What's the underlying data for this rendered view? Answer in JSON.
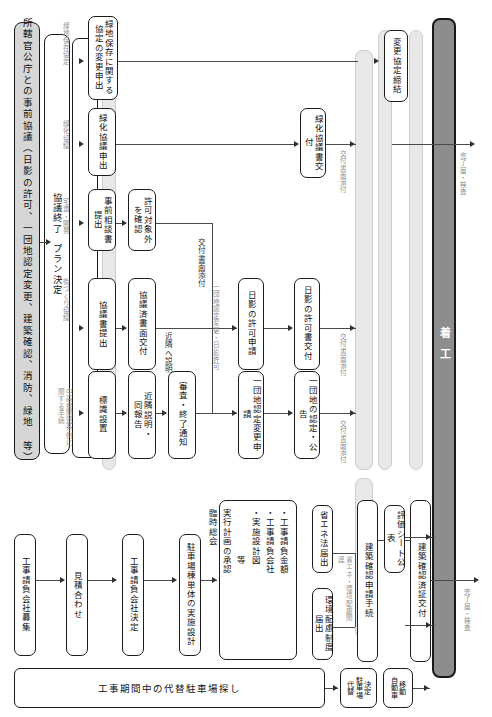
{
  "diagram": {
    "type": "flowchart",
    "orientation": "left-to-right",
    "colors": {
      "line": "#4a4a4a",
      "node_border": "#1c1c1c",
      "lane_fill": "#e8e8e8",
      "pillar_fill": "#d6d6d6",
      "dark_pillar_fill": "#8d8d8d",
      "edge_label": "#8f8f8f",
      "background": "#ffffff"
    }
  },
  "pillars": {
    "consultation": "所轄官公庁との事前協議（日影の許可、一団地認定変更、建築確認、消防、緑地 等）",
    "plan_decided": "協議終了　プラン決定",
    "start_construction": "着工"
  },
  "lanes": [
    {
      "name": "lane-agreement"
    },
    {
      "name": "lane-submission"
    },
    {
      "name": "lane-certificate"
    },
    {
      "name": "lane-energy"
    },
    {
      "name": "lane-confirmation"
    }
  ],
  "branches": [
    {
      "label": "緑地保存協定",
      "nodes": [
        "緑地保存に関する\n協定の変更申出"
      ]
    },
    {
      "label": "緑化協議",
      "nodes": [
        "緑化協議申出"
      ]
    },
    {
      "label": "宅造・開発",
      "nodes": [
        "事前相談書\n提出",
        "許可対象外\nを確認"
      ]
    },
    {
      "label": "街づくり協議",
      "nodes": [
        "協議書提出",
        "協議済書面交付"
      ]
    },
    {
      "label": "中高層関連条例に\n関する手続",
      "nodes": [
        "標識設置",
        "近隣説明・\n同報告",
        "審査・終了通知"
      ]
    }
  ],
  "nodes": {
    "green_preserve_change": "緑地保存に関する\n協定の変更申出",
    "green_plan_offer": "緑化協議申出",
    "pre_consult_doc": "事前相談書\n提出",
    "confirm_exempt": "許可対象外\nを確認",
    "submit_consult_doc": "協議書提出",
    "issue_consulted_doc": "協議済書面交付",
    "sign_install": "標識設置",
    "neighbor_explain": "近隣説明・\n同報告",
    "review_end_notice": "審査・終了通知",
    "green_plan_doc_issue": "緑化協議書交付",
    "shadow_permit_apply": "日影の許可申請",
    "shadow_permit_issue": "日影の許可書交付",
    "estate_change_apply": "一団地認定変更申請",
    "estate_certify_notice": "一団地の認定・公告",
    "change_agreement_conclude": "変更協定締結",
    "contractor_recruit": "工事請負会社募集",
    "quote_compare": "見積合わせ",
    "contractor_decide": "工事請負会社決定",
    "parking_design": "駐車場棟単体の実施設計",
    "energy_law_submit": "省エネ法届出",
    "env_consideration_submit": "環境配慮制度届出",
    "building_confirm_procedure": "建築確認申請手続",
    "eval_sheet_publish": "評価シート公表",
    "building_confirm_cert": "建築確認済証交付",
    "alt_parking_decide": "決定\n駐車場\n代替",
    "vehicle_move": "移動\n自動車",
    "alt_parking_search": "工事期間中の代替駐車場探し"
  },
  "group_box": {
    "name": "臨時総会",
    "header": "臨時総会",
    "subheader": "実行計画の承認",
    "items": [
      "・工事請負金額",
      "・工事請負会社",
      "・実施設計図",
      "　　　　　等"
    ]
  },
  "edge_labels": {
    "green_preserve": "緑地保存協定",
    "greening": "緑化協議",
    "dev_permit": "宅造・開発",
    "town_plan": "街づくり協議",
    "midrise_ordinance": "中高層関連条例に\n関する手続",
    "attach_doc_1": "交付書面添付",
    "neighbor_explain_edge": "近隣へ説明",
    "estate_shadow": "一団地認定変更・日影許可",
    "attach_doc_2": "交付書面添付",
    "attach_doc_3": "交付書面添付",
    "attach_doc_4": "交付書面添付",
    "energy_env_related": "省エネ・環境配慮関連",
    "completion_inspection_top": "完了届・検査",
    "completion_inspection_bottom": "完了届・検査"
  }
}
